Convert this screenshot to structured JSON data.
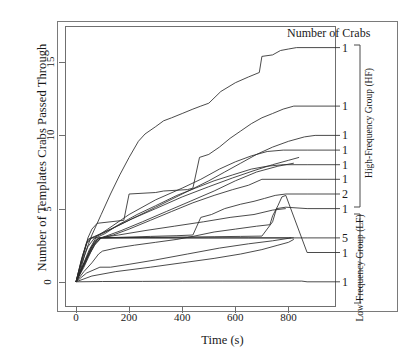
{
  "chart_data": {
    "type": "line",
    "title": "",
    "legend_title": "Number of Crabs",
    "xlabel": "Time (s)",
    "ylabel": "Number of Templates Crabs Passed Through",
    "xlim": [
      -30,
      960
    ],
    "ylim": [
      -0.9,
      17.2
    ],
    "xticks": [
      0,
      200,
      400,
      600,
      800
    ],
    "yticks": [
      0,
      5,
      10,
      15
    ],
    "grid": false,
    "legend_position": "right",
    "groups": [
      {
        "name": "High-Frequency Group (HF)",
        "abbrev": "HF"
      },
      {
        "name": "Low-Frequency Group (LF)",
        "abbrev": "LF"
      }
    ],
    "series": [
      {
        "id": "hf-1",
        "group": "HF",
        "crabs": "1",
        "label_y": 16,
        "points": [
          [
            0,
            0
          ],
          [
            20,
            1
          ],
          [
            35,
            2
          ],
          [
            60,
            3.2
          ],
          [
            95,
            4.6
          ],
          [
            130,
            6
          ],
          [
            165,
            7.3
          ],
          [
            200,
            8.5
          ],
          [
            235,
            9.6
          ],
          [
            260,
            10.1
          ],
          [
            300,
            10.6
          ],
          [
            330,
            11
          ],
          [
            360,
            11.2
          ],
          [
            400,
            11.5
          ],
          [
            440,
            11.8
          ],
          [
            470,
            12
          ],
          [
            500,
            12.2
          ],
          [
            545,
            13
          ],
          [
            600,
            13.6
          ],
          [
            650,
            14
          ],
          [
            690,
            14.3
          ],
          [
            700,
            15.4
          ],
          [
            740,
            15.5
          ],
          [
            770,
            15.8
          ],
          [
            800,
            15.9
          ],
          [
            830,
            16
          ]
        ]
      },
      {
        "id": "hf-2",
        "group": "HF",
        "crabs": "1",
        "label_y": 12,
        "points": [
          [
            0,
            0
          ],
          [
            25,
            1.6
          ],
          [
            45,
            3
          ],
          [
            60,
            3.6
          ],
          [
            80,
            4
          ],
          [
            180,
            4.2
          ],
          [
            200,
            6
          ],
          [
            300,
            6.1
          ],
          [
            330,
            6.2
          ],
          [
            420,
            6.3
          ],
          [
            440,
            6.4
          ],
          [
            465,
            8.5
          ],
          [
            500,
            8.7
          ],
          [
            540,
            9.2
          ],
          [
            580,
            9.8
          ],
          [
            620,
            10.3
          ],
          [
            660,
            10.8
          ],
          [
            700,
            11.2
          ],
          [
            740,
            11.5
          ],
          [
            780,
            11.8
          ],
          [
            820,
            12
          ]
        ]
      },
      {
        "id": "hf-3",
        "group": "HF",
        "crabs": "1",
        "label_y": 10,
        "points": [
          [
            0,
            0
          ],
          [
            20,
            1.4
          ],
          [
            40,
            2.6
          ],
          [
            60,
            3
          ],
          [
            100,
            3.3
          ],
          [
            200,
            4.2
          ],
          [
            300,
            5.1
          ],
          [
            400,
            6
          ],
          [
            500,
            6.9
          ],
          [
            560,
            7.5
          ],
          [
            620,
            8.1
          ],
          [
            680,
            8.7
          ],
          [
            740,
            9.2
          ],
          [
            800,
            9.6
          ],
          [
            860,
            9.9
          ],
          [
            900,
            10
          ]
        ]
      },
      {
        "id": "hf-4",
        "group": "HF",
        "crabs": "1",
        "label_y": 9,
        "points": [
          [
            0,
            0
          ],
          [
            20,
            1.2
          ],
          [
            45,
            2.4
          ],
          [
            70,
            3
          ],
          [
            120,
            3.6
          ],
          [
            200,
            4.6
          ],
          [
            300,
            5.6
          ],
          [
            400,
            6.4
          ],
          [
            470,
            7
          ],
          [
            540,
            7.7
          ],
          [
            600,
            8.2
          ],
          [
            660,
            8.6
          ],
          [
            720,
            8.9
          ],
          [
            780,
            9
          ],
          [
            870,
            9
          ]
        ]
      },
      {
        "id": "hf-5",
        "group": "HF",
        "crabs": "1",
        "label_y": 8,
        "points": [
          [
            0,
            0
          ],
          [
            25,
            1.1
          ],
          [
            50,
            2.2
          ],
          [
            75,
            3
          ],
          [
            110,
            3.3
          ],
          [
            160,
            3.9
          ],
          [
            230,
            4.6
          ],
          [
            300,
            5.2
          ],
          [
            380,
            5.9
          ],
          [
            450,
            6.4
          ],
          [
            520,
            6.9
          ],
          [
            590,
            7.3
          ],
          [
            660,
            7.7
          ],
          [
            720,
            7.9
          ],
          [
            780,
            8
          ],
          [
            870,
            8
          ]
        ]
      },
      {
        "id": "hf-6",
        "group": "HF",
        "crabs": "1",
        "label_y": 7,
        "points": [
          [
            0,
            0
          ],
          [
            20,
            0.9
          ],
          [
            45,
            1.8
          ],
          [
            70,
            2.6
          ],
          [
            95,
            3
          ],
          [
            140,
            3.2
          ],
          [
            200,
            3.6
          ],
          [
            280,
            4.2
          ],
          [
            360,
            4.8
          ],
          [
            440,
            5.4
          ],
          [
            520,
            5.9
          ],
          [
            590,
            6.3
          ],
          [
            650,
            6.6
          ],
          [
            700,
            7
          ],
          [
            870,
            7
          ]
        ]
      },
      {
        "id": "hf-7",
        "group": "HF",
        "crabs": "2",
        "label_y": 6,
        "points": [
          [
            0,
            0
          ],
          [
            20,
            0.8
          ],
          [
            45,
            1.7
          ],
          [
            70,
            2.5
          ],
          [
            95,
            3
          ],
          [
            180,
            3.05
          ],
          [
            280,
            3.1
          ],
          [
            380,
            3.15
          ],
          [
            440,
            3.2
          ],
          [
            470,
            4.4
          ],
          [
            510,
            4.6
          ],
          [
            560,
            5
          ],
          [
            620,
            5.3
          ],
          [
            670,
            5.5
          ],
          [
            710,
            5.7
          ],
          [
            750,
            5.9
          ],
          [
            790,
            6
          ],
          [
            870,
            6
          ]
        ]
      },
      {
        "id": "lf-1",
        "group": "LF",
        "crabs": "1",
        "label_y": 5,
        "points": [
          [
            0,
            0
          ],
          [
            25,
            1
          ],
          [
            50,
            2
          ],
          [
            70,
            2.8
          ],
          [
            90,
            3
          ],
          [
            180,
            3.02
          ],
          [
            300,
            3.04
          ],
          [
            420,
            3.06
          ],
          [
            520,
            3.08
          ],
          [
            620,
            3.1
          ],
          [
            700,
            3.12
          ],
          [
            740,
            4.1
          ],
          [
            755,
            5
          ],
          [
            790,
            5.1
          ],
          [
            870,
            5
          ]
        ]
      },
      {
        "id": "lf-2",
        "group": "LF",
        "crabs": "5",
        "label_y": 3,
        "points": [
          [
            0,
            0
          ],
          [
            30,
            1
          ],
          [
            55,
            2
          ],
          [
            75,
            2.7
          ],
          [
            95,
            3
          ],
          [
            200,
            3
          ],
          [
            350,
            3
          ],
          [
            500,
            3
          ],
          [
            650,
            3
          ],
          [
            800,
            3
          ],
          [
            870,
            3
          ]
        ]
      },
      {
        "id": "lf-3",
        "group": "LF",
        "crabs": "1",
        "label_y": 2,
        "points": [
          [
            0,
            0
          ],
          [
            30,
            0.7
          ],
          [
            60,
            1.3
          ],
          [
            85,
            1.9
          ],
          [
            100,
            2.1
          ],
          [
            150,
            2.3
          ],
          [
            220,
            2.5
          ],
          [
            300,
            2.7
          ],
          [
            380,
            2.9
          ],
          [
            440,
            3.1
          ],
          [
            520,
            3.4
          ],
          [
            600,
            3.6
          ],
          [
            680,
            3.8
          ],
          [
            730,
            3.9
          ],
          [
            740,
            4.5
          ],
          [
            760,
            5.2
          ],
          [
            775,
            5.8
          ],
          [
            790,
            5.9
          ],
          [
            870,
            2
          ]
        ]
      },
      {
        "id": "lf-4",
        "group": "LF",
        "crabs": "1",
        "label_y": 0,
        "points": [
          [
            0,
            0
          ],
          [
            100,
            0.02
          ],
          [
            250,
            0.03
          ],
          [
            400,
            0.04
          ],
          [
            550,
            0.05
          ],
          [
            700,
            0.05
          ],
          [
            850,
            0.05
          ],
          [
            870,
            0
          ]
        ]
      },
      {
        "id": "mid-a",
        "group": "LF",
        "crabs": "",
        "label_y": null,
        "points": [
          [
            0,
            0
          ],
          [
            20,
            1.5
          ],
          [
            40,
            2.7
          ],
          [
            55,
            3
          ],
          [
            120,
            3
          ],
          [
            250,
            3
          ],
          [
            400,
            3
          ],
          [
            550,
            3
          ],
          [
            700,
            3
          ],
          [
            820,
            3
          ]
        ]
      },
      {
        "id": "mid-b",
        "group": "HF",
        "crabs": "",
        "label_y": null,
        "points": [
          [
            0,
            0
          ],
          [
            30,
            1.2
          ],
          [
            55,
            2.3
          ],
          [
            80,
            2.9
          ],
          [
            110,
            3.1
          ],
          [
            170,
            3.5
          ],
          [
            250,
            4.1
          ],
          [
            340,
            4.8
          ],
          [
            430,
            5.5
          ],
          [
            520,
            6.2
          ],
          [
            600,
            6.9
          ],
          [
            680,
            7.5
          ],
          [
            760,
            7.9
          ],
          [
            820,
            8.1
          ]
        ]
      },
      {
        "id": "mid-c",
        "group": "LF",
        "crabs": "",
        "label_y": null,
        "points": [
          [
            0,
            0
          ],
          [
            40,
            0.6
          ],
          [
            90,
            1
          ],
          [
            130,
            1
          ],
          [
            200,
            1.2
          ],
          [
            300,
            1.5
          ],
          [
            420,
            1.9
          ],
          [
            540,
            2.3
          ],
          [
            650,
            2.6
          ],
          [
            740,
            2.8
          ],
          [
            810,
            3
          ]
        ]
      },
      {
        "id": "mid-d",
        "group": "LF",
        "crabs": "",
        "label_y": null,
        "points": [
          [
            0,
            0
          ],
          [
            60,
            0.4
          ],
          [
            150,
            0.7
          ],
          [
            280,
            1
          ],
          [
            400,
            1.3
          ],
          [
            520,
            1.6
          ],
          [
            620,
            1.9
          ],
          [
            700,
            2.2
          ],
          [
            760,
            2.5
          ],
          [
            800,
            2.7
          ],
          [
            820,
            2.9
          ]
        ]
      },
      {
        "id": "mid-e",
        "group": "HF",
        "crabs": "",
        "label_y": null,
        "points": [
          [
            0,
            0
          ],
          [
            25,
            1.8
          ],
          [
            45,
            2.9
          ],
          [
            70,
            3.1
          ],
          [
            130,
            3.6
          ],
          [
            210,
            4.3
          ],
          [
            300,
            5
          ],
          [
            400,
            5.8
          ],
          [
            500,
            6.5
          ],
          [
            590,
            7.1
          ],
          [
            670,
            7.6
          ],
          [
            740,
            8
          ],
          [
            800,
            8.3
          ],
          [
            840,
            8.5
          ]
        ]
      },
      {
        "id": "mid-f",
        "group": "LF",
        "crabs": "",
        "label_y": null,
        "points": [
          [
            0,
            0
          ],
          [
            35,
            1.3
          ],
          [
            60,
            2.4
          ],
          [
            85,
            3
          ],
          [
            160,
            3.2
          ],
          [
            260,
            3.5
          ],
          [
            370,
            3.8
          ],
          [
            480,
            4.1
          ],
          [
            580,
            4.4
          ],
          [
            670,
            4.6
          ],
          [
            740,
            4.9
          ],
          [
            790,
            5
          ]
        ]
      }
    ]
  }
}
